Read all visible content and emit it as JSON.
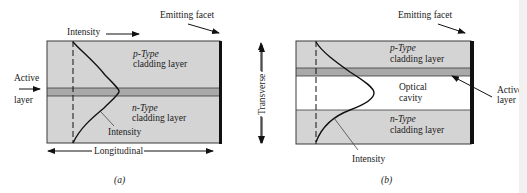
{
  "colors": {
    "cladding": "#d4d4d4",
    "active_layer": "#a9a9a9",
    "optical_cavity": "#ffffff",
    "outline": "#3a3a3a",
    "facet": "#111111",
    "curve": "#111111"
  },
  "panel_a": {
    "caption": "(a)",
    "intensity_top_label": "Intensity",
    "emitting_facet_label": "Emitting facet",
    "active_layer_label_line1": "Active",
    "active_layer_label_line2": "layer",
    "p_type_line1": "p-Type",
    "p_type_line2": "cladding layer",
    "n_type_line1": "n-Type",
    "n_type_line2": "cladding layer",
    "intensity_curve_label": "Intensity",
    "longitudinal_label": "Longitudinal",
    "transverse_label": "Transverse"
  },
  "panel_b": {
    "caption": "(b)",
    "emitting_facet_label": "Emitting facet",
    "p_type_line1": "p-Type",
    "p_type_line2": "cladding layer",
    "optical_cavity_line1": "Optical",
    "optical_cavity_line2": "cavity",
    "n_type_line1": "n-Type",
    "n_type_line2": "cladding layer",
    "active_layer_label_line1": "Active",
    "active_layer_label_line2": "layer",
    "intensity_curve_label": "Intensity",
    "transverse_label": "Transverse"
  }
}
